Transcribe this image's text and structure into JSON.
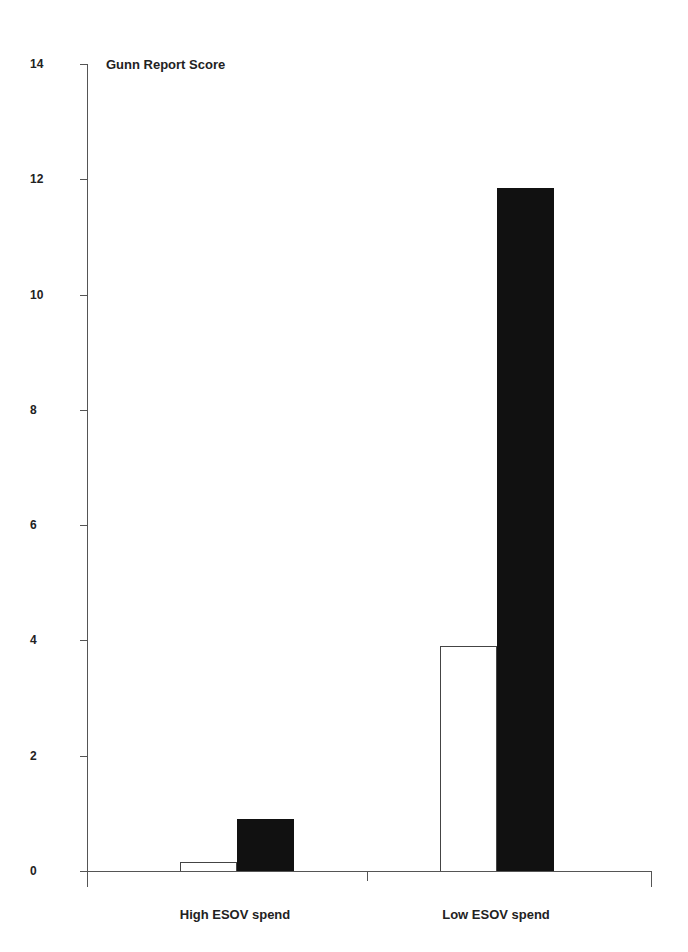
{
  "chart_data": {
    "type": "bar",
    "title": "Gunn Report Score",
    "xlabel": "",
    "ylabel": "Gunn Report Score",
    "categories": [
      "High ESOV spend",
      "Low ESOV spend"
    ],
    "series": [
      {
        "name": "Series 1 (white)",
        "color": "#ffffff",
        "values": [
          0.15,
          3.9
        ]
      },
      {
        "name": "Series 2 (black)",
        "color": "#111111",
        "values": [
          0.9,
          11.85
        ]
      }
    ],
    "ylim": [
      0,
      14
    ],
    "yticks": [
      0,
      2,
      4,
      6,
      8,
      10,
      12,
      14
    ],
    "grid": false,
    "legend": null
  },
  "labels": {
    "title": "Gunn Report Score",
    "yticks": [
      "0",
      "2",
      "4",
      "6",
      "8",
      "10",
      "12",
      "14"
    ],
    "categories": [
      "High ESOV spend",
      "Low ESOV spend"
    ]
  }
}
